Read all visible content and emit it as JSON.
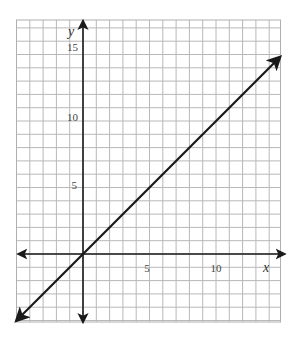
{
  "chart_data": {
    "type": "line",
    "title": "",
    "xlabel": "x",
    "ylabel": "y",
    "xlim": [
      -5,
      15
    ],
    "ylim": [
      -5,
      17
    ],
    "grid": true,
    "grid_step": 1,
    "x_ticks": [
      5,
      10
    ],
    "y_ticks": [
      5,
      10,
      15
    ],
    "x_tick_labels": [
      "5",
      "10"
    ],
    "y_tick_labels": [
      "5",
      "10",
      "15"
    ],
    "series": [
      {
        "name": "y = x",
        "x": [
          -5,
          14.8
        ],
        "y": [
          -5,
          14.8
        ],
        "arrows": "both"
      }
    ],
    "axes_arrows": true,
    "legend": null
  },
  "colors": {
    "grid": "#b8b8b8",
    "axis": "#1a1a1a",
    "line": "#1a1a1a",
    "background": "#ffffff"
  },
  "labels": {
    "x_axis": "x",
    "y_axis": "y",
    "x_tick_5": "5",
    "x_tick_10": "10",
    "y_tick_5": "5",
    "y_tick_10": "10",
    "y_tick_15": "15"
  }
}
